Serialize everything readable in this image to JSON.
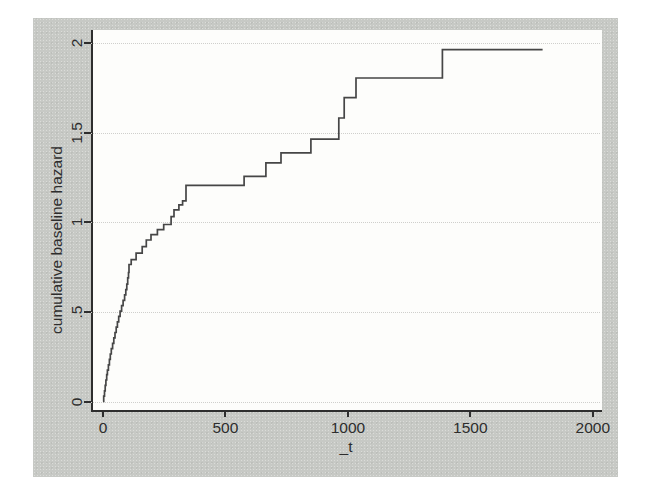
{
  "figure": {
    "kind": "stata-survival-plot",
    "outer_bg_color": "#c7c9c5",
    "plot_bg_color": "#fdfdfb",
    "line_color": "#464646",
    "grid_color": "#cfcfcc",
    "text_color": "#2d2d2d"
  },
  "chart_data": {
    "type": "line",
    "subtype": "step-after",
    "title": "",
    "xlabel": "_t",
    "ylabel": "cumulative baseline hazard",
    "xlim": [
      0,
      2000
    ],
    "ylim": [
      0,
      2
    ],
    "grid": "horizontal-dotted",
    "legend": "none",
    "x_tick_values": [
      0,
      500,
      1000,
      1500,
      2000
    ],
    "x_tick_labels": [
      "0",
      "500",
      "1000",
      "1500",
      "2000"
    ],
    "y_tick_values": [
      0,
      0.5,
      1,
      1.5,
      2
    ],
    "y_tick_labels": [
      "0",
      ".5",
      "1",
      "1.5",
      "2"
    ],
    "series": [
      {
        "name": "cumulative baseline hazard",
        "points": [
          [
            0,
            0
          ],
          [
            3,
            0.03
          ],
          [
            6,
            0.06
          ],
          [
            9,
            0.09
          ],
          [
            12,
            0.12
          ],
          [
            15,
            0.15
          ],
          [
            18,
            0.175
          ],
          [
            22,
            0.205
          ],
          [
            26,
            0.235
          ],
          [
            30,
            0.265
          ],
          [
            34,
            0.295
          ],
          [
            39,
            0.325
          ],
          [
            44,
            0.355
          ],
          [
            49,
            0.385
          ],
          [
            54,
            0.415
          ],
          [
            59,
            0.445
          ],
          [
            64,
            0.475
          ],
          [
            70,
            0.505
          ],
          [
            76,
            0.535
          ],
          [
            82,
            0.565
          ],
          [
            88,
            0.595
          ],
          [
            93,
            0.625
          ],
          [
            97,
            0.655
          ],
          [
            101,
            0.69
          ],
          [
            104,
            0.72
          ],
          [
            106,
            0.765
          ],
          [
            115,
            0.792
          ],
          [
            135,
            0.828
          ],
          [
            160,
            0.865
          ],
          [
            177,
            0.902
          ],
          [
            196,
            0.932
          ],
          [
            222,
            0.96
          ],
          [
            248,
            0.988
          ],
          [
            278,
            1.032
          ],
          [
            290,
            1.07
          ],
          [
            310,
            1.098
          ],
          [
            325,
            1.12
          ],
          [
            339,
            1.207
          ],
          [
            576,
            1.257
          ],
          [
            665,
            1.332
          ],
          [
            727,
            1.388
          ],
          [
            849,
            1.465
          ],
          [
            963,
            1.583
          ],
          [
            985,
            1.697
          ],
          [
            1033,
            1.806
          ],
          [
            1386,
            1.965
          ],
          [
            1795,
            1.965
          ]
        ]
      }
    ]
  }
}
